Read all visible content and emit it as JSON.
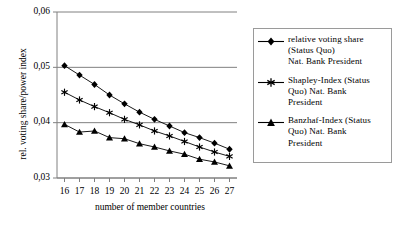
{
  "chart_data": {
    "type": "line",
    "title": "",
    "xlabel": "number of member countries",
    "ylabel": "rel. voting share/power index",
    "x": [
      16,
      17,
      18,
      19,
      20,
      21,
      22,
      23,
      24,
      25,
      26,
      27
    ],
    "xtick_labels": [
      "16",
      "17",
      "18",
      "19",
      "20",
      "21",
      "22",
      "23",
      "24",
      "25",
      "26",
      "27"
    ],
    "ytick_labels": [
      "0,06",
      "0,05",
      "0,04",
      "0,03"
    ],
    "ytick_values": [
      0.06,
      0.05,
      0.04,
      0.03
    ],
    "ylim": [
      0.03,
      0.06
    ],
    "xlim": [
      15.5,
      27.5
    ],
    "grid": "horizontal-major",
    "legend_position": "right-outside",
    "series": [
      {
        "name": "relative voting share (Status Quo) Nat. Bank President",
        "marker": "diamond",
        "values": [
          0.0503,
          0.0486,
          0.0469,
          0.045,
          0.0434,
          0.0419,
          0.0406,
          0.0394,
          0.0382,
          0.0373,
          0.0363,
          0.0352
        ]
      },
      {
        "name": "Shapley-Index (Status Quo) Nat. Bank President",
        "marker": "star",
        "values": [
          0.0455,
          0.0441,
          0.0429,
          0.0418,
          0.0406,
          0.0396,
          0.0385,
          0.0376,
          0.0366,
          0.0356,
          0.0347,
          0.0339
        ]
      },
      {
        "name": "Banzhaf-Index (Status Quo) Nat. Bank President",
        "marker": "triangle",
        "values": [
          0.0397,
          0.0383,
          0.0385,
          0.0373,
          0.0371,
          0.0362,
          0.0356,
          0.0349,
          0.0343,
          0.0334,
          0.0329,
          0.0322
        ]
      }
    ]
  },
  "legend": {
    "entries": [
      {
        "marker": "diamond",
        "label": "relative voting share\n(Status Quo)\nNat. Bank President"
      },
      {
        "marker": "star",
        "label": "Shapley-Index (Status\nQuo) Nat. Bank\nPresident"
      },
      {
        "marker": "triangle",
        "label": "Banzhaf-Index (Status\nQuo) Nat. Bank\nPresident"
      }
    ]
  },
  "colors": {
    "series_line": "#000000",
    "gridline": "#808080",
    "axis": "#808080",
    "legend_border": "#9a9a9a",
    "background": "#ffffff"
  }
}
